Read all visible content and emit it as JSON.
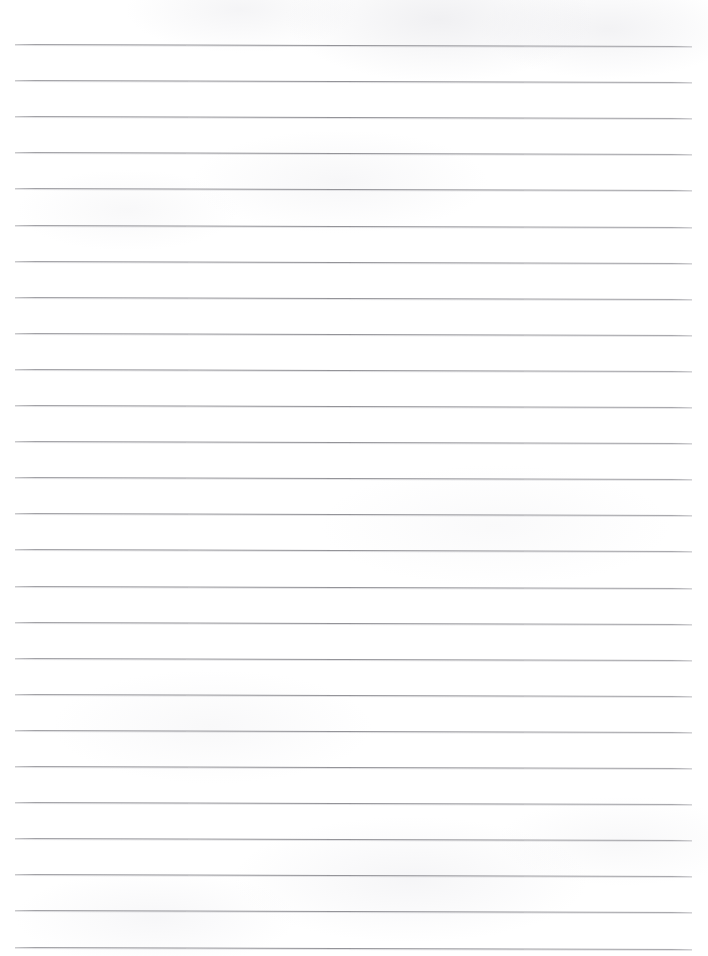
{
  "document": {
    "type": "scanned-lined-paper",
    "title": "Blank Lined Paper",
    "description": "Scanned blank sheet of ruled notebook paper with no handwriting or printed text",
    "text_content": "",
    "page_width_px": 708,
    "page_height_px": 956,
    "background_color": "#ffffff"
  },
  "ruling": {
    "line_color": "#96969b",
    "line_shadow_color": "#ceced2",
    "line_thickness_px": 1,
    "line_count": 26,
    "first_line_y_px": 44,
    "line_spacing_px": 36.1,
    "left_margin_px": 15,
    "right_edge_px": 692,
    "line_length_px": 677,
    "skew_degrees": 0.17,
    "lines": [
      {
        "index": 1,
        "y": 44.0,
        "content": ""
      },
      {
        "index": 2,
        "y": 80.1,
        "content": ""
      },
      {
        "index": 3,
        "y": 116.2,
        "content": ""
      },
      {
        "index": 4,
        "y": 152.3,
        "content": ""
      },
      {
        "index": 5,
        "y": 188.4,
        "content": ""
      },
      {
        "index": 6,
        "y": 224.5,
        "content": ""
      },
      {
        "index": 7,
        "y": 260.6,
        "content": ""
      },
      {
        "index": 8,
        "y": 296.7,
        "content": ""
      },
      {
        "index": 9,
        "y": 332.8,
        "content": ""
      },
      {
        "index": 10,
        "y": 368.9,
        "content": ""
      },
      {
        "index": 11,
        "y": 405.0,
        "content": ""
      },
      {
        "index": 12,
        "y": 441.1,
        "content": ""
      },
      {
        "index": 13,
        "y": 477.2,
        "content": ""
      },
      {
        "index": 14,
        "y": 513.3,
        "content": ""
      },
      {
        "index": 15,
        "y": 549.4,
        "content": ""
      },
      {
        "index": 16,
        "y": 585.5,
        "content": ""
      },
      {
        "index": 17,
        "y": 621.6,
        "content": ""
      },
      {
        "index": 18,
        "y": 657.7,
        "content": ""
      },
      {
        "index": 19,
        "y": 693.8,
        "content": ""
      },
      {
        "index": 20,
        "y": 729.9,
        "content": ""
      },
      {
        "index": 21,
        "y": 766.0,
        "content": ""
      },
      {
        "index": 22,
        "y": 802.1,
        "content": ""
      },
      {
        "index": 23,
        "y": 838.2,
        "content": ""
      },
      {
        "index": 24,
        "y": 874.3,
        "content": ""
      },
      {
        "index": 25,
        "y": 910.4,
        "content": ""
      },
      {
        "index": 26,
        "y": 946.5,
        "content": ""
      }
    ]
  }
}
